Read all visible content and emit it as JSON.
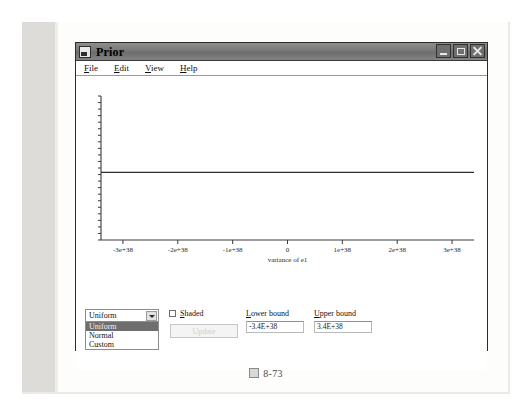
{
  "window": {
    "title": "Prior",
    "icon": "window-app-icon",
    "buttons": {
      "minimize": "minimize-button",
      "maximize": "maximize-button",
      "close": "close-button"
    }
  },
  "menubar": {
    "items": [
      {
        "mnemonic": "F",
        "rest": "ile"
      },
      {
        "mnemonic": "E",
        "rest": "dit"
      },
      {
        "mnemonic": "V",
        "rest": "iew"
      },
      {
        "mnemonic": "H",
        "rest": "elp"
      }
    ]
  },
  "chart_data": {
    "type": "line",
    "title": "",
    "xlabel": "variance of e1",
    "ylabel": "",
    "xlim": [
      -3.4e+38,
      3.4e+38
    ],
    "ylim": [
      0,
      1
    ],
    "grid": false,
    "legend": null,
    "x_ticks": [
      {
        "value": -3e+38,
        "label": "-3e+38"
      },
      {
        "value": -2e+38,
        "label": "-2e+38"
      },
      {
        "value": -1e+38,
        "label": "-1e+38"
      },
      {
        "value": 0,
        "label": "0"
      },
      {
        "value": 1e+38,
        "label": "1e+38"
      },
      {
        "value": 2e+38,
        "label": "2e+38"
      },
      {
        "value": 3e+38,
        "label": "3e+38"
      }
    ],
    "y_ticks_labeled": false,
    "y_minor_tick_count": 22,
    "series": [
      {
        "name": "Uniform prior density",
        "x": [
          -3.4e+38,
          3.4e+38
        ],
        "values": [
          0.47,
          0.47
        ]
      }
    ]
  },
  "controls": {
    "distribution_select": {
      "name": "distribution-select",
      "value": "Uniform",
      "expanded": true,
      "options": [
        "Uniform",
        "Normal",
        "Custom"
      ],
      "selected_index": 0
    },
    "shaded_checkbox": {
      "checked": false,
      "mnemonic": "S",
      "rest": "haded"
    },
    "update_button": {
      "label": "Update",
      "enabled": false
    },
    "lower_bound": {
      "mnemonic": "L",
      "rest": "ower bound",
      "value": "-3.4E+38"
    },
    "upper_bound": {
      "mnemonic": "U",
      "rest": "pper bound",
      "value": "3.4E+38"
    }
  },
  "figure_caption": {
    "marker": "figure-marker",
    "number": "8-73"
  }
}
